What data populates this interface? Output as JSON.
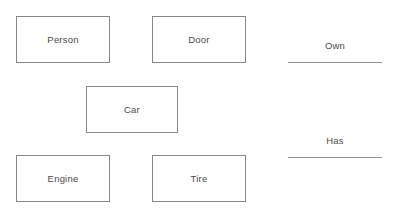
{
  "diagram": {
    "background_color": "#ffffff",
    "box_border_color": "#878787",
    "text_color": "#4a4a4a",
    "rule_color": "#909090",
    "entities": [
      {
        "id": "person",
        "label": "Person"
      },
      {
        "id": "door",
        "label": "Door"
      },
      {
        "id": "car",
        "label": "Car"
      },
      {
        "id": "engine",
        "label": "Engine"
      },
      {
        "id": "tire",
        "label": "Tire"
      }
    ],
    "relationships": [
      {
        "id": "own",
        "label": "Own"
      },
      {
        "id": "has",
        "label": "Has"
      }
    ]
  }
}
